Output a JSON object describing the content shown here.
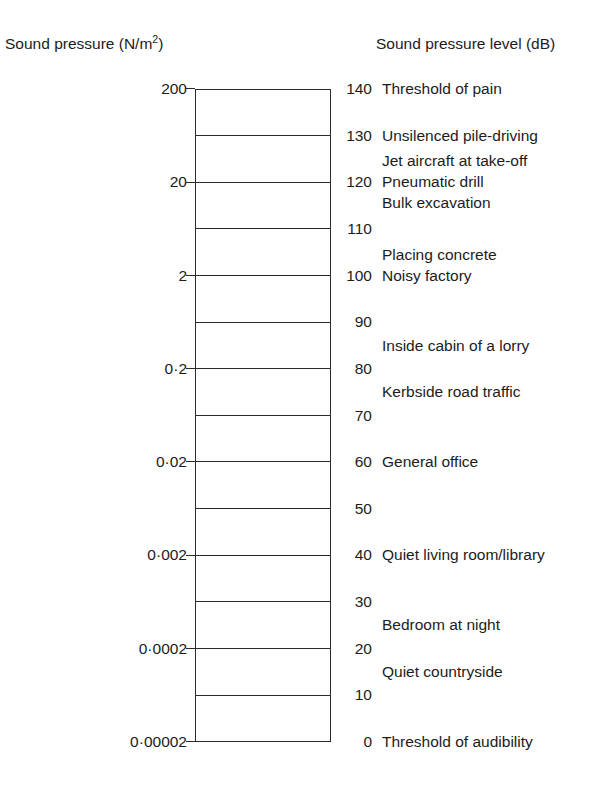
{
  "headers": {
    "left": "Sound pressure (N/m",
    "left_sup": "2",
    "left_tail": ")",
    "left_full": "Sound pressure (N/m2)",
    "right": "Sound pressure level (dB)"
  },
  "chart_data": {
    "type": "table",
    "xlabel": "",
    "ylabel": "Sound pressure level (dB)",
    "ylim": [
      0,
      140
    ],
    "grid": true,
    "legend": "none",
    "axis_columns": [
      "Sound pressure (N/m2)",
      "Sound pressure level (dB)",
      "Source"
    ],
    "tick_step_db": 10,
    "levels": [
      {
        "db": "140",
        "pressure": "200",
        "labelled": true,
        "sources": [
          "Threshold of pain"
        ]
      },
      {
        "db": "130",
        "pressure": "",
        "labelled": false,
        "sources": [
          "Unsilenced pile-driving"
        ]
      },
      {
        "db": "120",
        "pressure": "20",
        "labelled": true,
        "sources": [
          "Jet aircraft at take-off",
          "Pneumatic drill",
          "Bulk excavation"
        ]
      },
      {
        "db": "110",
        "pressure": "",
        "labelled": false,
        "sources": []
      },
      {
        "db": "100",
        "pressure": "2",
        "labelled": true,
        "sources": [
          "Placing concrete",
          "Noisy factory"
        ]
      },
      {
        "db": "90",
        "pressure": "",
        "labelled": false,
        "sources": []
      },
      {
        "db": "80",
        "pressure": "0·2",
        "labelled": true,
        "sources": []
      },
      {
        "db": "70",
        "pressure": "",
        "labelled": false,
        "sources": []
      },
      {
        "db": "60",
        "pressure": "0·02",
        "labelled": true,
        "sources": [
          "General office"
        ]
      },
      {
        "db": "50",
        "pressure": "",
        "labelled": false,
        "sources": []
      },
      {
        "db": "40",
        "pressure": "0·002",
        "labelled": true,
        "sources": [
          "Quiet living room/library"
        ]
      },
      {
        "db": "30",
        "pressure": "",
        "labelled": false,
        "sources": []
      },
      {
        "db": "20",
        "pressure": "0·0002",
        "labelled": true,
        "sources": [
          "Quiet countryside"
        ]
      },
      {
        "db": "10",
        "pressure": "",
        "labelled": false,
        "sources": []
      },
      {
        "db": "0",
        "pressure": "0·00002",
        "labelled": true,
        "sources": [
          "Threshold of audibility"
        ]
      }
    ],
    "annotations": [
      {
        "text": "Threshold of pain",
        "db": 140,
        "offset_lines": 0
      },
      {
        "text": "Unsilenced pile-driving",
        "db": 130,
        "offset_lines": 0
      },
      {
        "text": "Jet aircraft at take-off",
        "db": 120,
        "offset_lines": -1
      },
      {
        "text": "Pneumatic drill",
        "db": 120,
        "offset_lines": 0
      },
      {
        "text": "Bulk excavation",
        "db": 120,
        "offset_lines": 1
      },
      {
        "text": "Placing concrete",
        "db": 100,
        "offset_lines": -1
      },
      {
        "text": "Noisy factory",
        "db": 100,
        "offset_lines": 0
      },
      {
        "text": "Inside cabin of a lorry",
        "db": 85,
        "offset_lines": 0
      },
      {
        "text": "Kerbside road traffic",
        "db": 75,
        "offset_lines": 0
      },
      {
        "text": "General office",
        "db": 60,
        "offset_lines": 0
      },
      {
        "text": "Quiet living room/library",
        "db": 40,
        "offset_lines": 0
      },
      {
        "text": "Bedroom at night",
        "db": 25,
        "offset_lines": 0
      },
      {
        "text": "Quiet countryside",
        "db": 15,
        "offset_lines": 0
      },
      {
        "text": "Threshold of audibility",
        "db": 0,
        "offset_lines": 0
      }
    ],
    "pressure_values": [
      "200",
      "20",
      "2",
      "0·2",
      "0·02",
      "0·002",
      "0·0002",
      "0·00002"
    ],
    "pressure_db_positions": [
      140,
      120,
      100,
      80,
      60,
      40,
      20,
      0
    ],
    "db_values": [
      "140",
      "130",
      "120",
      "110",
      "100",
      "90",
      "80",
      "70",
      "60",
      "50",
      "40",
      "30",
      "20",
      "10",
      "0"
    ]
  },
  "style": {
    "line_color": "#2b2b2b",
    "text_color": "#1c1c1c",
    "background": "#ffffff"
  }
}
